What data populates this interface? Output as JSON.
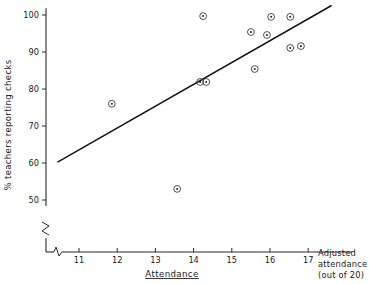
{
  "chart_data": {
    "type": "scatter",
    "title": "",
    "xlabel": "Attendance",
    "ylabel": "% teachers reporting checks",
    "x_axis_note_lines": [
      "Adjusted",
      "attendance",
      "(out of 20)"
    ],
    "xlim": [
      10.4,
      17.4
    ],
    "ylim": [
      46.0,
      101.5
    ],
    "x_ticks": [
      11,
      12,
      13,
      14,
      15,
      16,
      17
    ],
    "y_ticks": [
      50,
      60,
      70,
      80,
      90,
      100
    ],
    "x_tick_labels": [
      "11",
      "12",
      "13",
      "14",
      "15",
      "16",
      "17"
    ],
    "y_tick_labels": [
      "50",
      "60",
      "70",
      "80",
      "90",
      "100"
    ],
    "axis_break_x": true,
    "axis_break_y": true,
    "grid": false,
    "legend": null,
    "series": [
      {
        "name": "schools",
        "marker": "circle-with-center-dot",
        "points": [
          {
            "x": 11.86,
            "y": 76.0
          },
          {
            "x": 13.57,
            "y": 53.0
          },
          {
            "x": 14.17,
            "y": 81.9
          },
          {
            "x": 14.33,
            "y": 81.9
          },
          {
            "x": 14.25,
            "y": 99.7
          },
          {
            "x": 15.5,
            "y": 95.4
          },
          {
            "x": 15.6,
            "y": 85.4
          },
          {
            "x": 15.92,
            "y": 94.6
          },
          {
            "x": 16.03,
            "y": 99.5
          },
          {
            "x": 16.53,
            "y": 99.5
          },
          {
            "x": 16.53,
            "y": 91.1
          },
          {
            "x": 16.81,
            "y": 91.6
          }
        ]
      }
    ],
    "fit_line": {
      "name": "regression line",
      "x_start": 10.45,
      "y_start": 60.3,
      "x_end": 17.6,
      "y_end": 102.5
    },
    "colors": {
      "axis": "#2b2b2b",
      "marker": "#3a3a3a",
      "fit_line": "#141414",
      "background": "#ffffff",
      "text": "#1a1a1a"
    }
  }
}
